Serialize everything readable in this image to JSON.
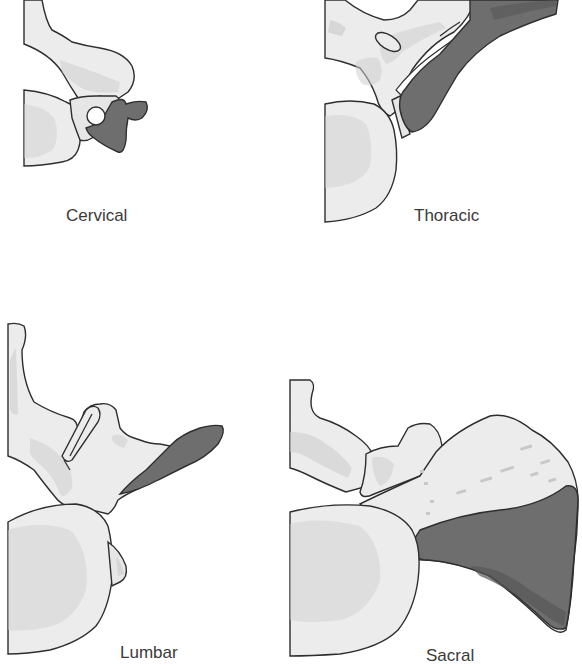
{
  "figure": {
    "panels": [
      {
        "id": "cervical",
        "label": "Cervical"
      },
      {
        "id": "thoracic",
        "label": "Thoracic"
      },
      {
        "id": "lumbar",
        "label": "Lumbar"
      },
      {
        "id": "sacral",
        "label": "Sacral"
      }
    ],
    "colors": {
      "bone": "#ececec",
      "bone_shading": "#cfcfcf",
      "highlighted_region": "#6e6e6e",
      "outline": "#2e2e2e",
      "background": "#ffffff"
    }
  }
}
